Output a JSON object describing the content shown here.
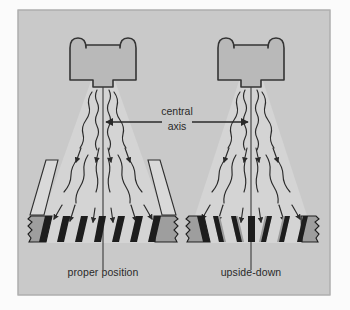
{
  "figure": {
    "title_visible": false,
    "frame": {
      "x": 18,
      "y": 10,
      "width": 312,
      "height": 285
    },
    "colors": {
      "page_background": "#fbfbfb",
      "panel_background": "#c9c9c9",
      "frame_border": "#a8a8a8",
      "head_fill": "#b8b8b8",
      "head_stroke": "#3a3a3a",
      "tooth_dark": "#1e1e1e",
      "tooth_shadow": "#9a9a9a",
      "ramp_fill": "#d8d8d8",
      "beam_fill": "#d2d2d2",
      "line_ink": "#2a2a2a",
      "text_ink": "#2a2a2a"
    },
    "labels": {
      "center_line1": "central",
      "center_line2": "axis",
      "left_caption": "proper position",
      "right_caption": "upside-down"
    },
    "panels": [
      {
        "id": "left",
        "caption": "proper position",
        "orientation": "proper",
        "center_x": 103,
        "head": {
          "cx": 103,
          "cy": 58,
          "width": 74,
          "height": 44,
          "bumps": 2
        },
        "tooth_count": 7,
        "tooth_slant": "right",
        "has_ramp": true,
        "ray_count": 10
      },
      {
        "id": "right",
        "caption": "upside-down",
        "orientation": "inverted",
        "center_x": 251,
        "head": {
          "cx": 251,
          "cy": 58,
          "width": 74,
          "height": 44,
          "bumps": 2
        },
        "tooth_count": 7,
        "tooth_slant": "left",
        "has_ramp": false,
        "ray_count": 10
      }
    ],
    "central_axis_arrow": {
      "label": "central axis",
      "left_arrow_tip_x": 103,
      "right_arrow_tip_x": 251,
      "y": 122,
      "double_headed": true
    }
  }
}
